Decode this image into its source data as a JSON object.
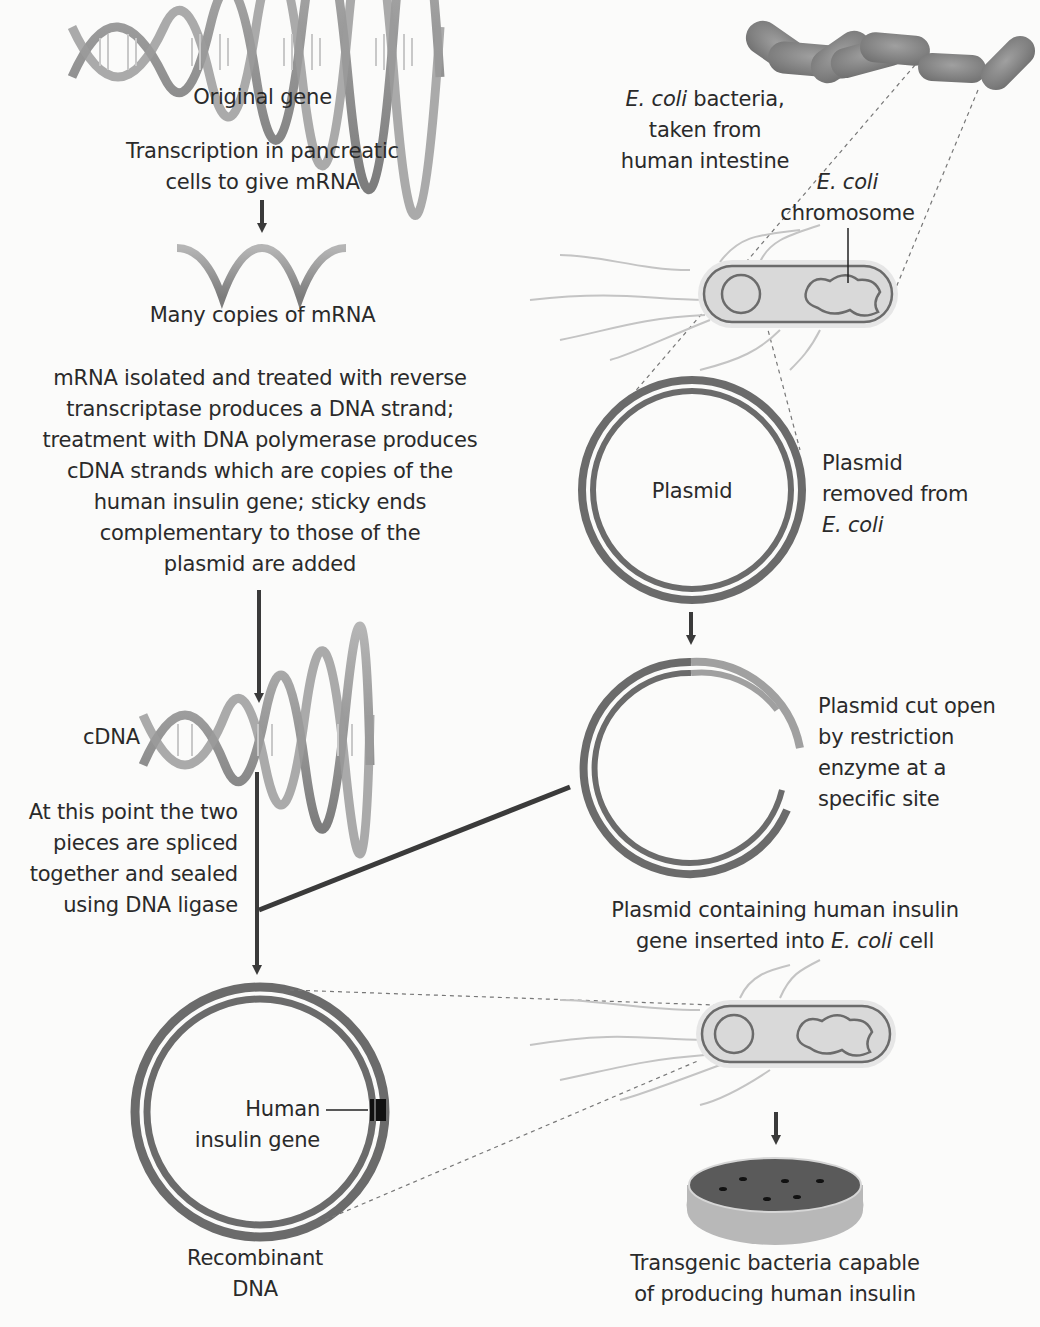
{
  "left_column": {
    "original_gene": "Original gene",
    "transcription": [
      "Transcription in pancreatic",
      "cells to give mRNA"
    ],
    "mrna_copies": "Many copies of mRNA",
    "reverse_transcription": [
      "mRNA isolated and treated with reverse",
      "transcriptase produces a DNA strand;",
      "treatment with DNA polymerase produces",
      "cDNA strands which are copies of the",
      "human insulin gene; sticky ends",
      "complementary to those of the",
      "plasmid are added"
    ],
    "cdna": "cDNA",
    "splicing": [
      "At this point the two",
      "pieces are spliced",
      "together and sealed",
      "using DNA ligase"
    ],
    "human_gene": [
      "Human",
      "insulin gene"
    ],
    "recombinant": [
      "Recombinant",
      "DNA"
    ]
  },
  "right_column": {
    "ecoli_italic": "E. coli",
    "ecoli_rest": " bacteria,",
    "ecoli_lines": [
      "taken from",
      "human intestine"
    ],
    "chromosome": [
      "E. coli",
      "chromosome"
    ],
    "plasmid_center": "Plasmid",
    "plasmid_removed": [
      "Plasmid",
      "removed from",
      "E. coli"
    ],
    "plasmid_cut": [
      "Plasmid cut open",
      "by restriction",
      "enzyme at a",
      "specific site"
    ],
    "inserted_line1": "Plasmid containing human insulin",
    "inserted_line2_pre": "gene inserted into ",
    "inserted_line2_italic": "E. coli",
    "inserted_line2_post": " cell",
    "transgenic": [
      "Transgenic bacteria capable",
      "of producing human insulin"
    ]
  },
  "colors": {
    "strand": "#6b6b6b",
    "strand_light": "#9a9a9a",
    "arrow": "#3a3a3a",
    "bacteria": "#8a8a8a",
    "cell_fill": "#d9d9d9",
    "dish_agar": "#5a5a5a"
  }
}
